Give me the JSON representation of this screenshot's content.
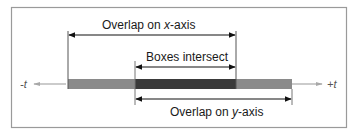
{
  "diagram": {
    "type": "interval-overlap",
    "axis": {
      "left_label": "-t",
      "right_label": "+t"
    },
    "labels": {
      "x_overlap": "Overlap on x-axis",
      "intersect": "Boxes intersect",
      "y_overlap": "Overlap on y-axis"
    },
    "intervals": {
      "x_extent": [
        0,
        2
      ],
      "y_extent": [
        1,
        3
      ],
      "intersection": [
        1,
        2
      ]
    },
    "colors": {
      "frame": "#9a9a9a",
      "axis": "#a8a8a8",
      "bar_light": "#8a8a8a",
      "bar_dark": "#3a3a3a",
      "arrow": "#111111",
      "guide": "#555555"
    }
  }
}
